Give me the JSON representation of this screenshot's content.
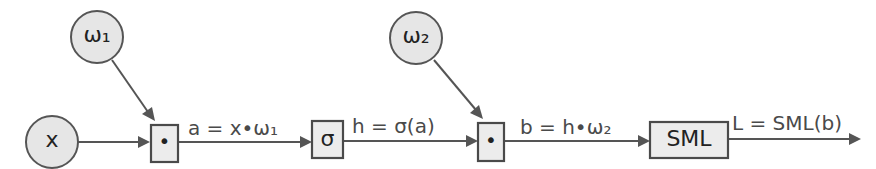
{
  "diagram": {
    "type": "computation-graph",
    "nodes": {
      "x": {
        "label": "x",
        "shape": "circle"
      },
      "w1": {
        "label": "ω₁",
        "shape": "circle"
      },
      "mul1": {
        "label": "•",
        "shape": "box"
      },
      "sigma": {
        "label": "σ",
        "shape": "box"
      },
      "w2": {
        "label": "ω₂",
        "shape": "circle"
      },
      "mul2": {
        "label": "•",
        "shape": "box"
      },
      "sml": {
        "label": "SML",
        "shape": "box"
      }
    },
    "edges": [
      {
        "from": "x",
        "to": "mul1",
        "label": ""
      },
      {
        "from": "w1",
        "to": "mul1",
        "label": ""
      },
      {
        "from": "mul1",
        "to": "sigma",
        "label": "a = x•ω₁"
      },
      {
        "from": "sigma",
        "to": "mul2",
        "label": "h = σ(a)"
      },
      {
        "from": "w2",
        "to": "mul2",
        "label": ""
      },
      {
        "from": "mul2",
        "to": "sml",
        "label": "b = h•ω₂"
      },
      {
        "from": "sml",
        "to": "output",
        "label": "L = SML(b)"
      }
    ]
  },
  "colors": {
    "node_fill": "#e6e6e6",
    "stroke": "#555555",
    "text": "#3a3a3a"
  }
}
